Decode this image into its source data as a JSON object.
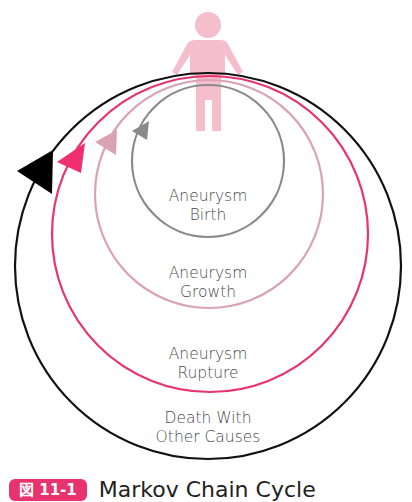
{
  "diagram": {
    "title": "Markov Chain Cycle",
    "figure_badge": "図 11-1",
    "states": [
      {
        "name": "Aneurysm Birth",
        "line1": "Aneurysm",
        "line2": "Birth",
        "color": "#8a8a8a"
      },
      {
        "name": "Aneurysm Growth",
        "line1": "Aneurysm",
        "line2": "Growth",
        "color": "#d9a3b3"
      },
      {
        "name": "Aneurysm Rupture",
        "line1": "Aneurysm",
        "line2": "Rupture",
        "color": "#e8336e"
      },
      {
        "name": "Death With Other Causes",
        "line1": "Death With",
        "line2": "Other Causes",
        "color": "#111111"
      }
    ],
    "person_icon_color": "#f4b8c8",
    "badge_color": "#e8336e"
  }
}
